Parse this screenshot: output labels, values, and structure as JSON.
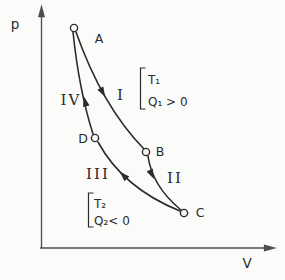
{
  "colors": {
    "background": "#fbfbf9",
    "ink": "#2b2b2b",
    "axis": "#4d4d4d"
  },
  "chart_data": {
    "type": "line",
    "title": "",
    "xlabel": "V",
    "ylabel": "p",
    "grid": false,
    "cycle": "A → B → C → D → A",
    "axes": {
      "origin": {
        "x": 40,
        "y": 248
      },
      "x_tip": {
        "x": 271,
        "y": 248
      },
      "y_tip": {
        "x": 41.5,
        "y": 10
      },
      "x_label": "V",
      "y_label": "p",
      "x_label_pos": {
        "x": 247,
        "y": 268
      },
      "y_label_pos": {
        "x": 15,
        "y": 29
      }
    },
    "states": [
      {
        "name": "A",
        "px": 74,
        "py": 28,
        "label_x": 99,
        "label_y": 43
      },
      {
        "name": "B",
        "px": 146,
        "py": 152,
        "label_x": 160,
        "label_y": 156
      },
      {
        "name": "C",
        "px": 184,
        "py": 213,
        "label_x": 200,
        "label_y": 217
      },
      {
        "name": "D",
        "px": 95,
        "py": 138,
        "label_x": 83,
        "label_y": 143
      }
    ],
    "point_radius": 3.6,
    "processes": [
      {
        "name": "I",
        "from": "A",
        "to": "B",
        "path": {
          "x1": 76,
          "y1": 32,
          "cx": 102,
          "cy": 106,
          "x2": 144,
          "y2": 149
        },
        "label_x": 121,
        "label_y": 100,
        "arrow": {
          "x": 103,
          "y": 93,
          "angle": 61
        }
      },
      {
        "name": "II",
        "from": "B",
        "to": "C",
        "path": {
          "x1": 148,
          "y1": 156,
          "cx": 152,
          "cy": 186,
          "x2": 181,
          "y2": 210
        },
        "label_x": 175,
        "label_y": 183,
        "arrow": {
          "x": 152,
          "y": 175,
          "angle": 65
        }
      },
      {
        "name": "III",
        "from": "C",
        "to": "D",
        "path": {
          "x1": 180,
          "y1": 211,
          "cx": 123,
          "cy": 188,
          "x2": 98,
          "y2": 142
        },
        "label_x": 98,
        "label_y": 179,
        "arrow": {
          "x": 123,
          "y": 175,
          "angle": -135
        }
      },
      {
        "name": "IV",
        "from": "D",
        "to": "A",
        "path": {
          "x1": 93,
          "y1": 134,
          "cx": 79,
          "cy": 90,
          "x2": 73,
          "y2": 32
        },
        "label_x": 71,
        "label_y": 105,
        "arrow": {
          "x": 85,
          "y": 101,
          "angle": -103
        }
      }
    ],
    "annotations": [
      {
        "name": "hot-reservoir",
        "lines": [
          "T₁",
          "Q₁ > 0"
        ],
        "bracket": {
          "x": 140.5,
          "y": 68,
          "h": 41,
          "w": 5
        },
        "text_x": 148,
        "line_ys": [
          84,
          106
        ]
      },
      {
        "name": "cold-reservoir",
        "lines": [
          "T₂",
          "Q₂< 0"
        ],
        "bracket": {
          "x": 88.5,
          "y": 193,
          "h": 34,
          "w": 5
        },
        "text_x": 94,
        "line_ys": [
          208,
          225
        ]
      }
    ]
  }
}
